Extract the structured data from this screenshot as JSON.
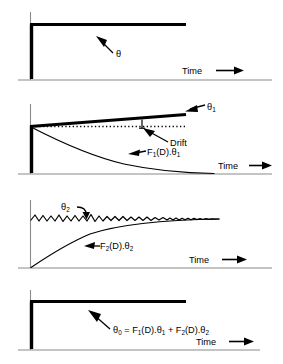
{
  "figure": {
    "background_color": "#ffffff",
    "ink_color": "#000000",
    "axis_color": "#8a8a8a"
  },
  "common": {
    "time_axis_label": "Time",
    "time_arrow_icon": "right-arrow-icon",
    "theta_glyph": "θ"
  },
  "panels": [
    {
      "id": "panel-input-step",
      "index": 1,
      "signal_label": "θ",
      "signal_subscript": "",
      "time_label": "Time",
      "description": "Flat constant step response at top, thick horizontal line",
      "curves": [
        {
          "name": "step-response",
          "style": "thick",
          "type": "constant",
          "value": 1.0
        }
      ],
      "annotations": [
        {
          "name": "theta-callout",
          "text": "θ",
          "subscript": "",
          "arrow": "up-left"
        }
      ]
    },
    {
      "id": "panel-drift-component",
      "index": 2,
      "signal_label": "θ",
      "signal_subscript": "1",
      "time_label": "Time",
      "description": "Upward drifting line with dotted reference and decaying transient",
      "curves": [
        {
          "name": "drifting-signal",
          "style": "thick",
          "type": "ramp",
          "start_value": 1.0,
          "end_value": 1.25
        },
        {
          "name": "reference-dotted",
          "style": "dotted",
          "type": "constant",
          "value": 1.0
        },
        {
          "name": "decay-response",
          "style": "thin",
          "type": "exponential-decay",
          "start_value": 1.0,
          "end_value": 0.0
        }
      ],
      "annotations": [
        {
          "name": "theta1-callout",
          "text": "θ",
          "subscript": "1",
          "arrow": "left"
        },
        {
          "name": "drift-callout",
          "text": "Drift",
          "subscript": "",
          "arrow": "up-left"
        },
        {
          "name": "f1-callout",
          "text": "F₁(D).θ₁",
          "parts": [
            "F",
            "1",
            "(D).",
            "θ",
            "1"
          ],
          "arrow": "left"
        }
      ]
    },
    {
      "id": "panel-noise-component",
      "index": 3,
      "signal_label": "θ",
      "signal_subscript": "2",
      "time_label": "Time",
      "description": "Oscillating noisy signal above a rising exponential response",
      "curves": [
        {
          "name": "oscillating-signal",
          "style": "thin",
          "type": "damped-oscillation",
          "mean_value": 1.0
        },
        {
          "name": "rise-response",
          "style": "thin",
          "type": "exponential-rise",
          "start_value": 0.0,
          "end_value": 1.0
        }
      ],
      "annotations": [
        {
          "name": "theta2-callout",
          "text": "θ",
          "subscript": "2",
          "arrow": "down-right"
        },
        {
          "name": "f2-callout",
          "text": "F₂(D).θ₂",
          "parts": [
            "F",
            "2",
            "(D).",
            "θ",
            "2"
          ],
          "arrow": "left"
        }
      ]
    },
    {
      "id": "panel-output-sum",
      "index": 4,
      "signal_label": "θ",
      "signal_subscript": "0",
      "time_label": "Time",
      "description": "Flat combined output with summation equation",
      "curves": [
        {
          "name": "output-response",
          "style": "thick",
          "type": "constant",
          "value": 1.0
        }
      ],
      "annotations": [
        {
          "name": "output-equation-callout",
          "text": "θ₀ = F₁(D).θ₁ + F₂(D).θ₂",
          "equation": {
            "lhs_base": "θ",
            "lhs_sub": "0",
            "equals": "=",
            "term1_base": "F",
            "term1_sub": "1",
            "term1_mid": "(D).",
            "term1_theta": "θ",
            "term1_theta_sub": "1",
            "plus": "+",
            "term2_base": "F",
            "term2_sub": "2",
            "term2_mid": "(D).",
            "term2_theta": "θ",
            "term2_theta_sub": "2"
          },
          "arrow": "up-left"
        }
      ]
    }
  ]
}
